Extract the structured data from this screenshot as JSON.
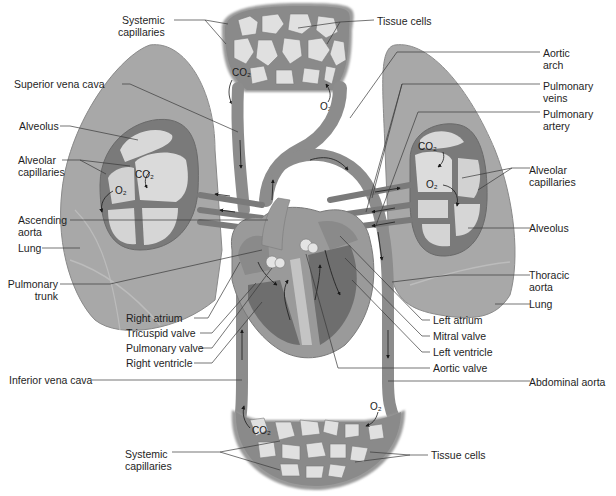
{
  "diagram": {
    "colors": {
      "vessel": "#8c8c8c",
      "vessel_dark": "#6e6e6e",
      "lung": "#a9a9a9",
      "alveolus": "#d6d6d6",
      "tissue_cell": "#e2e2e2",
      "heart": "#9a9a9a",
      "leader_line": "#3a3a3a",
      "background": "#ffffff"
    },
    "chem": {
      "co2": "CO₂",
      "o2": "O₂"
    },
    "labels": {
      "systemic_capillaries_top": "Systemic\ncapillaries",
      "tissue_cells_top": "Tissue cells",
      "superior_vena_cava": "Superior vena cava",
      "aortic_arch": "Aortic\narch",
      "alveolus_left": "Alveolus",
      "pulmonary_veins": "Pulmonary\nveins",
      "pulmonary_artery": "Pulmonary\nartery",
      "alveolar_capillaries_left": "Alveolar\ncapillaries",
      "alveolar_capillaries_right": "Alveolar\ncapillaries",
      "ascending_aorta": "Ascending\naorta",
      "lung_left": "Lung",
      "alveolus_right": "Alveolus",
      "pulmonary_trunk": "Pulmonary\ntrunk",
      "thoracic_aorta": "Thoracic\naorta",
      "lung_right": "Lung",
      "right_atrium": "Right atrium",
      "tricuspid_valve": "Tricuspid valve",
      "pulmonary_valve": "Pulmonary valve",
      "right_ventricle": "Right ventricle",
      "left_atrium": "Left atrium",
      "mitral_valve": "Mitral valve",
      "left_ventricle": "Left ventricle",
      "aortic_valve": "Aortic valve",
      "inferior_vena_cava": "Inferior vena cava",
      "abdominal_aorta": "Abdominal aorta",
      "systemic_capillaries_bottom": "Systemic\ncapillaries",
      "tissue_cells_bottom": "Tissue cells"
    }
  }
}
